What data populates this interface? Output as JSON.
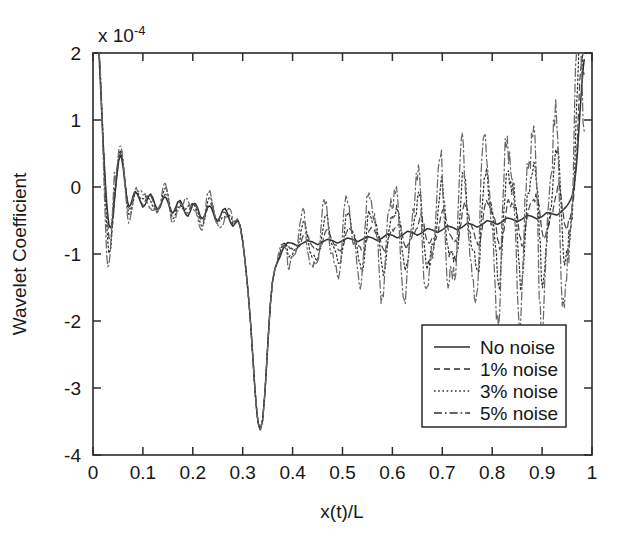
{
  "figure": {
    "background": "#ffffff",
    "ink_color": "#2b2b2b"
  },
  "chart_data": {
    "type": "line",
    "title": "",
    "xlabel": "x(t)/L",
    "ylabel": "Wavelet Coefficient",
    "y_exponent_label": "x 10",
    "y_exponent_power": "-4",
    "y_scale_factor": 0.0001,
    "xlim": [
      0,
      1
    ],
    "ylim": [
      -4,
      2
    ],
    "xticks": [
      0,
      0.1,
      0.2,
      0.3,
      0.4,
      0.5,
      0.6,
      0.7,
      0.8,
      0.9,
      1
    ],
    "xticklabels": [
      "0",
      "0.1",
      "0.2",
      "0.3",
      "0.4",
      "0.5",
      "0.6",
      "0.7",
      "0.8",
      "0.9",
      "1"
    ],
    "yticks": [
      2,
      1,
      0,
      -1,
      -2,
      -3,
      -4
    ],
    "yticklabels": [
      "2",
      "1",
      "0",
      "-1",
      "-2",
      "-3",
      "-4"
    ],
    "grid": false,
    "legend_position": "lower-right",
    "legend_entries": [
      "No noise",
      "1% noise",
      "3% noise",
      "5% noise"
    ],
    "series": [
      {
        "name": "No noise",
        "style": "solid",
        "x": [
          0.012,
          0.016,
          0.02,
          0.024,
          0.028,
          0.032,
          0.036,
          0.04,
          0.044,
          0.048,
          0.052,
          0.056,
          0.06,
          0.064,
          0.068,
          0.072,
          0.076,
          0.08,
          0.085,
          0.09,
          0.095,
          0.1,
          0.105,
          0.11,
          0.115,
          0.12,
          0.125,
          0.13,
          0.135,
          0.14,
          0.145,
          0.15,
          0.155,
          0.16,
          0.165,
          0.17,
          0.175,
          0.18,
          0.185,
          0.19,
          0.195,
          0.2,
          0.205,
          0.21,
          0.215,
          0.22,
          0.225,
          0.23,
          0.235,
          0.24,
          0.245,
          0.25,
          0.255,
          0.26,
          0.265,
          0.27,
          0.275,
          0.28,
          0.285,
          0.29,
          0.295,
          0.3,
          0.305,
          0.31,
          0.315,
          0.32,
          0.325,
          0.33,
          0.335,
          0.34,
          0.345,
          0.35,
          0.355,
          0.36,
          0.365,
          0.37,
          0.375,
          0.38,
          0.39,
          0.4,
          0.41,
          0.42,
          0.43,
          0.44,
          0.45,
          0.46,
          0.47,
          0.48,
          0.49,
          0.5,
          0.51,
          0.52,
          0.53,
          0.54,
          0.55,
          0.56,
          0.57,
          0.58,
          0.59,
          0.6,
          0.61,
          0.62,
          0.63,
          0.64,
          0.65,
          0.66,
          0.67,
          0.68,
          0.69,
          0.7,
          0.71,
          0.72,
          0.73,
          0.74,
          0.75,
          0.76,
          0.77,
          0.78,
          0.79,
          0.8,
          0.81,
          0.82,
          0.83,
          0.84,
          0.85,
          0.86,
          0.87,
          0.88,
          0.89,
          0.9,
          0.91,
          0.92,
          0.93,
          0.94,
          0.95,
          0.955,
          0.96,
          0.965,
          0.97,
          0.974,
          0.978,
          0.982,
          0.986
        ],
        "y": [
          2.0,
          1.35,
          0.7,
          0.15,
          -0.3,
          -0.58,
          -0.62,
          -0.45,
          -0.12,
          0.18,
          0.42,
          0.48,
          0.32,
          0.05,
          -0.18,
          -0.3,
          -0.26,
          -0.14,
          -0.06,
          -0.12,
          -0.22,
          -0.3,
          -0.26,
          -0.16,
          -0.1,
          -0.16,
          -0.28,
          -0.34,
          -0.28,
          -0.18,
          -0.14,
          -0.22,
          -0.34,
          -0.4,
          -0.32,
          -0.22,
          -0.2,
          -0.28,
          -0.4,
          -0.44,
          -0.36,
          -0.26,
          -0.24,
          -0.32,
          -0.44,
          -0.48,
          -0.4,
          -0.3,
          -0.28,
          -0.36,
          -0.48,
          -0.52,
          -0.44,
          -0.34,
          -0.32,
          -0.4,
          -0.52,
          -0.58,
          -0.52,
          -0.44,
          -0.44,
          -0.52,
          -0.6,
          -0.6,
          -0.52,
          -0.46,
          -0.5,
          -0.62,
          -0.56,
          -0.38,
          -0.2,
          -0.12,
          -0.22,
          -0.45,
          -0.7,
          -0.86,
          -0.92,
          -0.88,
          -0.82,
          -0.84,
          -0.88,
          -0.84,
          -0.8,
          -0.82,
          -0.86,
          -0.82,
          -0.78,
          -0.8,
          -0.84,
          -0.8,
          -0.76,
          -0.78,
          -0.82,
          -0.78,
          -0.74,
          -0.76,
          -0.8,
          -0.76,
          -0.7,
          -0.72,
          -0.76,
          -0.72,
          -0.66,
          -0.68,
          -0.72,
          -0.68,
          -0.62,
          -0.64,
          -0.68,
          -0.64,
          -0.58,
          -0.6,
          -0.64,
          -0.6,
          -0.54,
          -0.56,
          -0.6,
          -0.56,
          -0.5,
          -0.52,
          -0.56,
          -0.52,
          -0.46,
          -0.48,
          -0.52,
          -0.48,
          -0.42,
          -0.44,
          -0.48,
          -0.44,
          -0.38,
          -0.4,
          -0.42,
          -0.36,
          -0.28,
          -0.22,
          -0.14,
          0.05,
          0.4,
          0.9,
          1.35,
          1.75,
          2.0
        ],
        "note": "smooth baseline; large positive spike at both edges, deep trough near x=0.335 shared with all series"
      },
      {
        "name": "1% noise",
        "style": "dashed",
        "noise_amplitude_left": 0.05,
        "noise_amplitude_right": 0.25
      },
      {
        "name": "3% noise",
        "style": "dotted",
        "noise_amplitude_left": 0.12,
        "noise_amplitude_right": 0.62
      },
      {
        "name": "5% noise",
        "style": "dashdot",
        "noise_amplitude_left": 0.2,
        "noise_amplitude_right": 1.05
      }
    ],
    "features": {
      "left_edge_spike_x": 0.012,
      "left_edge_spike_y": 2.0,
      "right_edge_spike_x": 0.986,
      "right_edge_spike_y": 2.0,
      "main_trough_x": 0.335,
      "main_trough_y": -3.7,
      "secondary_peak_x": 0.056,
      "secondary_peak_y": 0.48,
      "oscillation_onset_x": 0.37,
      "oscillation_period": 0.046
    }
  }
}
